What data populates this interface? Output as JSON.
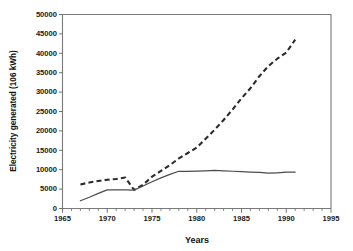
{
  "chart_data": {
    "type": "line",
    "title": "",
    "xlabel": "Years",
    "ylabel": "Electricity generated (106 kWh)",
    "xlim": [
      1965,
      1995
    ],
    "ylim": [
      0,
      50000
    ],
    "grid": false,
    "legend": "none",
    "x_ticks": [
      1965,
      1970,
      1975,
      1980,
      1985,
      1990,
      1995
    ],
    "x_tick_labels": [
      "1965",
      "1970",
      "1975",
      "1980",
      "1985",
      "1990",
      "1995"
    ],
    "x_minor_tick_step": 1,
    "y_ticks": [
      0,
      5000,
      10000,
      15000,
      20000,
      25000,
      30000,
      35000,
      40000,
      45000,
      50000
    ],
    "y_tick_labels": [
      "0",
      "5000",
      "10000",
      "15000",
      "20000",
      "25000",
      "30000",
      "35000",
      "40000",
      "45000",
      "50000"
    ],
    "series": [
      {
        "name": "dashed-series",
        "style": "dashed",
        "color": "#2b2b2b",
        "x": [
          1967,
          1968,
          1969,
          1970,
          1971,
          1972,
          1973,
          1974,
          1975,
          1976,
          1977,
          1978,
          1979,
          1980,
          1981,
          1982,
          1983,
          1984,
          1985,
          1986,
          1987,
          1988,
          1989,
          1990,
          1991
        ],
        "values": [
          6200,
          6700,
          7100,
          7400,
          7600,
          8000,
          4800,
          6100,
          8200,
          9700,
          11200,
          12900,
          14300,
          15700,
          18000,
          20300,
          22800,
          25500,
          28400,
          31000,
          34100,
          36700,
          38600,
          40200,
          43500
        ]
      },
      {
        "name": "solid-series",
        "style": "solid",
        "color": "#4c4c4c",
        "x": [
          1967,
          1968,
          1969,
          1970,
          1971,
          1972,
          1973,
          1974,
          1975,
          1976,
          1977,
          1978,
          1979,
          1980,
          1981,
          1982,
          1983,
          1984,
          1985,
          1986,
          1987,
          1988,
          1989,
          1990,
          1991
        ],
        "values": [
          2000,
          2900,
          3900,
          4800,
          4800,
          4800,
          4750,
          5800,
          6900,
          7900,
          8800,
          9600,
          9600,
          9650,
          9700,
          9800,
          9700,
          9600,
          9500,
          9400,
          9300,
          9100,
          9200,
          9350,
          9400
        ]
      }
    ]
  }
}
